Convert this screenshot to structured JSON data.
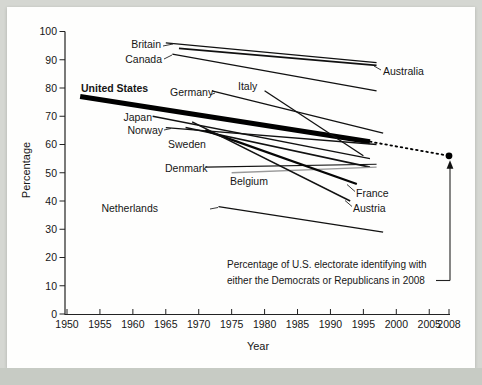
{
  "figure": {
    "kind": "scanned-book-figure",
    "page_background": "#d5d7d2",
    "panel_background": "#fefefd",
    "caption_band_color": "#c7cbc4"
  },
  "chart_data": {
    "type": "line",
    "title": "",
    "xlabel": "Year",
    "ylabel": "Percentage",
    "xlim": [
      1950,
      2008
    ],
    "ylim": [
      0,
      100
    ],
    "grid": false,
    "legend_position": "labels-on-lines",
    "x_ticks": [
      1950,
      1955,
      1960,
      1965,
      1970,
      1975,
      1980,
      1985,
      1990,
      1995,
      2000,
      2005,
      2008
    ],
    "y_ticks": [
      0,
      10,
      20,
      30,
      40,
      50,
      60,
      70,
      80,
      90,
      100
    ],
    "series": [
      {
        "name": "United States",
        "points": [
          [
            1952,
            77
          ],
          [
            1996,
            61
          ]
        ],
        "color": "#000000",
        "width": 5,
        "label": {
          "x": 81,
          "y": 92,
          "anchor": "start",
          "bold": true,
          "size": 11.5
        }
      },
      {
        "name": "United States dotted extension",
        "points": [
          [
            1996,
            61
          ],
          [
            2008,
            56
          ]
        ],
        "color": "#000000",
        "width": 1.8,
        "style": "dotted",
        "no_label": true
      },
      {
        "name": "Britain",
        "points": [
          [
            1965,
            96
          ],
          [
            1997,
            89
          ]
        ],
        "color": "#111111",
        "width": 1.3,
        "label": {
          "x": 161,
          "y": 48,
          "anchor": "end"
        },
        "leader": [
          163,
          46,
          173,
          44
        ]
      },
      {
        "name": "Canada",
        "points": [
          [
            1966,
            92
          ],
          [
            1997,
            79
          ]
        ],
        "color": "#111111",
        "width": 1.3,
        "label": {
          "x": 162,
          "y": 63,
          "anchor": "end"
        },
        "leader": [
          164,
          59,
          172,
          55
        ]
      },
      {
        "name": "Australia",
        "points": [
          [
            1967,
            94
          ],
          [
            1997,
            88
          ]
        ],
        "color": "#111111",
        "width": 1.8,
        "label": {
          "x": 383,
          "y": 75,
          "anchor": "start"
        },
        "leader": [
          374,
          66,
          381,
          70
        ]
      },
      {
        "name": "Germany",
        "points": [
          [
            1972,
            79
          ],
          [
            1998,
            64
          ]
        ],
        "color": "#111111",
        "width": 1.3,
        "label": {
          "x": 170,
          "y": 96,
          "anchor": "start"
        },
        "leader": [
          210,
          95,
          215,
          93
        ]
      },
      {
        "name": "Italy",
        "points": [
          [
            1980,
            79
          ],
          [
            1995,
            56
          ]
        ],
        "color": "#111111",
        "width": 1.3,
        "label": {
          "x": 238,
          "y": 90,
          "anchor": "start"
        }
      },
      {
        "name": "Japan",
        "points": [
          [
            1963,
            70
          ],
          [
            1996,
            55
          ]
        ],
        "color": "#111111",
        "width": 1.3,
        "label": {
          "x": 152,
          "y": 121,
          "anchor": "end"
        }
      },
      {
        "name": "Norway",
        "points": [
          [
            1965,
            66
          ],
          [
            1997,
            60
          ]
        ],
        "color": "#111111",
        "width": 1.3,
        "label": {
          "x": 163,
          "y": 134,
          "anchor": "end"
        },
        "leader": [
          164,
          130,
          171,
          128.5
        ]
      },
      {
        "name": "Sweden",
        "points": [
          [
            1968,
            66
          ],
          [
            1996,
            52
          ]
        ],
        "color": "#111111",
        "width": 1.6,
        "label": {
          "x": 168,
          "y": 148,
          "anchor": "start"
        }
      },
      {
        "name": "Denmark",
        "points": [
          [
            1971,
            52
          ],
          [
            1997,
            53
          ]
        ],
        "color": "#111111",
        "width": 1.1,
        "label": {
          "x": 165,
          "y": 172,
          "anchor": "start"
        }
      },
      {
        "name": "Belgium",
        "points": [
          [
            1975,
            50
          ],
          [
            1997,
            52
          ]
        ],
        "color": "#9a9a9a",
        "width": 1.4,
        "label": {
          "x": 230,
          "y": 185,
          "anchor": "start"
        }
      },
      {
        "name": "France",
        "points": [
          [
            1971,
            65
          ],
          [
            1994,
            46
          ]
        ],
        "color": "#050505",
        "width": 2.2,
        "label": {
          "x": 356,
          "y": 197,
          "anchor": "start"
        },
        "leader": [
          347,
          184.5,
          355,
          191.5
        ]
      },
      {
        "name": "Austria",
        "points": [
          [
            1969,
            68
          ],
          [
            1993,
            40
          ]
        ],
        "color": "#111111",
        "width": 1.5,
        "label": {
          "x": 353,
          "y": 212,
          "anchor": "start"
        },
        "leader": [
          345,
          200.5,
          352,
          206.5
        ]
      },
      {
        "name": "Netherlands",
        "points": [
          [
            1973,
            38
          ],
          [
            1998,
            29
          ]
        ],
        "color": "#111111",
        "width": 1.3,
        "label": {
          "x": 158,
          "y": 212,
          "anchor": "end",
          "label_x_override": 158
        },
        "leader": [
          210,
          209,
          218,
          207.5
        ]
      }
    ],
    "marker": {
      "x": 2008,
      "y": 56,
      "shape": "dot",
      "color": "#000000"
    },
    "annotation": {
      "line1": "Percentage of U.S. electorate identifying with",
      "line2": "either the Democrats or Republicans in 2008",
      "points_to": "marker"
    }
  }
}
